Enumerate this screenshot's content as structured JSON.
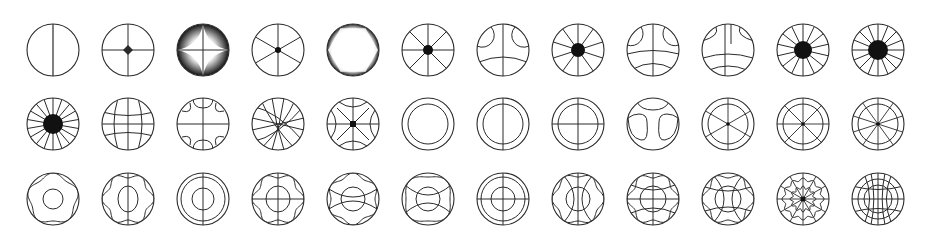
{
  "sheet": {
    "title": "",
    "background": "#ffffff",
    "stroke_color": "#2a2a2a",
    "columns": 12,
    "rows": 3,
    "col_x": [
      53,
      128,
      203,
      278,
      353,
      428,
      503,
      578,
      653,
      728,
      803,
      878
    ],
    "row_y": [
      50,
      124,
      199
    ],
    "radius": 26
  },
  "icons": [
    {
      "row": 0,
      "col": 0,
      "name": "circle-vertical-line-icon",
      "kind": "vline"
    },
    {
      "row": 0,
      "col": 1,
      "name": "circle-four-point-star-icon",
      "kind": "star4"
    },
    {
      "row": 0,
      "col": 2,
      "name": "shaded-sphere-cross-icon",
      "kind": "shaded-cross"
    },
    {
      "row": 0,
      "col": 3,
      "name": "circle-six-spoke-icon",
      "kind": "spokes",
      "spokes": 6,
      "hub": 3
    },
    {
      "row": 0,
      "col": 4,
      "name": "shaded-hexagon-circle-icon",
      "kind": "shaded-hex"
    },
    {
      "row": 0,
      "col": 5,
      "name": "circle-eight-spoke-icon",
      "kind": "spokes",
      "spokes": 8,
      "hub": 5
    },
    {
      "row": 0,
      "col": 6,
      "name": "circle-arcs-vertical-icon",
      "kind": "arcs-a"
    },
    {
      "row": 0,
      "col": 7,
      "name": "circle-ten-spoke-icon",
      "kind": "spokes",
      "spokes": 10,
      "hub": 7
    },
    {
      "row": 0,
      "col": 8,
      "name": "circle-arcs-grid-icon",
      "kind": "arcs-b"
    },
    {
      "row": 0,
      "col": 9,
      "name": "circle-arcs-double-icon",
      "kind": "arcs-c"
    },
    {
      "row": 0,
      "col": 10,
      "name": "circle-fourteen-spoke-icon",
      "kind": "spokes",
      "spokes": 14,
      "hub": 9
    },
    {
      "row": 0,
      "col": 11,
      "name": "circle-sixteen-spoke-icon",
      "kind": "spokes",
      "spokes": 16,
      "hub": 10
    },
    {
      "row": 1,
      "col": 0,
      "name": "circle-eighteen-spoke-icon",
      "kind": "spokes",
      "spokes": 18,
      "hub": 10
    },
    {
      "row": 1,
      "col": 1,
      "name": "circle-globe-grid-icon",
      "kind": "globe"
    },
    {
      "row": 1,
      "col": 2,
      "name": "circle-lobes-cross-icon",
      "kind": "lobes"
    },
    {
      "row": 1,
      "col": 3,
      "name": "circle-diagonal-mesh-icon",
      "kind": "mesh"
    },
    {
      "row": 1,
      "col": 4,
      "name": "circle-hyperbola-star-icon",
      "kind": "hyper"
    },
    {
      "row": 1,
      "col": 5,
      "name": "double-ring-icon",
      "kind": "ring"
    },
    {
      "row": 1,
      "col": 6,
      "name": "double-ring-vertical-icon",
      "kind": "ring-v"
    },
    {
      "row": 1,
      "col": 7,
      "name": "double-ring-cross-icon",
      "kind": "ring-cross"
    },
    {
      "row": 1,
      "col": 8,
      "name": "circle-wave-icon",
      "kind": "wave"
    },
    {
      "row": 1,
      "col": 9,
      "name": "ring-six-spoke-icon",
      "kind": "ring-spokes",
      "spokes": 6
    },
    {
      "row": 1,
      "col": 10,
      "name": "ring-eight-spoke-icon",
      "kind": "ring-spokes",
      "spokes": 8
    },
    {
      "row": 1,
      "col": 11,
      "name": "ring-ten-spoke-icon",
      "kind": "ring-spokes",
      "spokes": 10
    },
    {
      "row": 2,
      "col": 0,
      "name": "pentagon-wave-ring-icon",
      "kind": "penta",
      "lines": 0
    },
    {
      "row": 2,
      "col": 1,
      "name": "hexagon-wave-vertical-icon",
      "kind": "hexwave-v"
    },
    {
      "row": 2,
      "col": 2,
      "name": "triple-ring-vertical-icon",
      "kind": "tri-ring-v"
    },
    {
      "row": 2,
      "col": 3,
      "name": "hexagon-wave-cross-icon",
      "kind": "hexwave-cross"
    },
    {
      "row": 2,
      "col": 4,
      "name": "wave-lens-icon",
      "kind": "lens"
    },
    {
      "row": 2,
      "col": 5,
      "name": "square-wave-lens-icon",
      "kind": "lens2"
    },
    {
      "row": 2,
      "col": 6,
      "name": "triple-ring-cross-icon",
      "kind": "tri-ring-cross"
    },
    {
      "row": 2,
      "col": 7,
      "name": "wave-lens-vertical-icon",
      "kind": "lens-v"
    },
    {
      "row": 2,
      "col": 8,
      "name": "wave-web-cross-icon",
      "kind": "web-cross"
    },
    {
      "row": 2,
      "col": 9,
      "name": "wave-hourglass-icon",
      "kind": "hourglass"
    },
    {
      "row": 2,
      "col": 10,
      "name": "spider-web-icon",
      "kind": "web"
    },
    {
      "row": 2,
      "col": 11,
      "name": "sphere-grid-icon",
      "kind": "sphere"
    }
  ]
}
